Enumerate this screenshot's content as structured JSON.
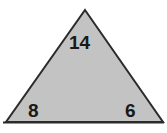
{
  "figure": {
    "type": "triangle",
    "shape_name": "isosceles-triangle",
    "background_color": "#ffffff",
    "fill_color": "#c3c3c3",
    "stroke_color": "#2b2b2b",
    "stroke_width": 2,
    "vertices": {
      "apex": [
        85,
        10
      ],
      "bottom_left": [
        6,
        122
      ],
      "bottom_right": [
        163,
        122
      ]
    },
    "labels": {
      "apex": "14",
      "bottom_left": "8",
      "bottom_right": "6"
    }
  },
  "chart_data": {
    "type": "diagram",
    "title": "",
    "shape": "triangle",
    "categories": [
      "top",
      "bottom-left",
      "bottom-right"
    ],
    "values": [
      14,
      8,
      6
    ],
    "annotations": [
      {
        "text": "14",
        "position": "apex-interior",
        "x": 79,
        "y": 42
      },
      {
        "text": "8",
        "position": "bottom-left-interior",
        "x": 34,
        "y": 110
      },
      {
        "text": "6",
        "position": "bottom-right-interior",
        "x": 131,
        "y": 110
      }
    ]
  }
}
